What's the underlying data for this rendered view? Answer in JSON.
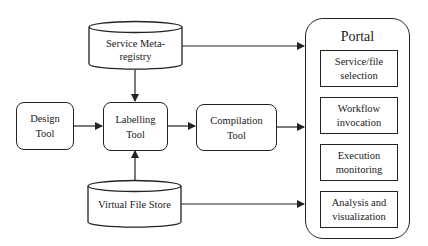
{
  "diagram": {
    "nodes": {
      "service_meta_registry": {
        "line1": "Service Meta-",
        "line2": "registry",
        "shape": "cylinder"
      },
      "design_tool": {
        "line1": "Design",
        "line2": "Tool",
        "shape": "rounded-rect"
      },
      "labelling_tool": {
        "line1": "Labelling",
        "line2": "Tool",
        "shape": "rounded-rect"
      },
      "compilation_tool": {
        "line1": "Compilation",
        "line2": "Tool",
        "shape": "rounded-rect"
      },
      "virtual_file_store": {
        "line1": "Virtual File Store",
        "shape": "cylinder"
      }
    },
    "portal": {
      "title": "Portal",
      "items": [
        {
          "line1": "Service/file",
          "line2": "selection"
        },
        {
          "line1": "Workflow",
          "line2": "invocation"
        },
        {
          "line1": "Execution",
          "line2": "monitoring"
        },
        {
          "line1": "Analysis and",
          "line2": "visualization"
        }
      ]
    },
    "edges": [
      {
        "from": "Service Meta-registry",
        "to": "Labelling Tool"
      },
      {
        "from": "Service Meta-registry",
        "to": "Portal"
      },
      {
        "from": "Design Tool",
        "to": "Labelling Tool"
      },
      {
        "from": "Labelling Tool",
        "to": "Compilation Tool"
      },
      {
        "from": "Compilation Tool",
        "to": "Portal"
      },
      {
        "from": "Virtual File Store",
        "to": "Labelling Tool"
      },
      {
        "from": "Virtual File Store",
        "to": "Portal"
      }
    ],
    "colors": {
      "stroke": "#222222",
      "fill": "#ffffff",
      "text": "#1a1a1a"
    }
  }
}
